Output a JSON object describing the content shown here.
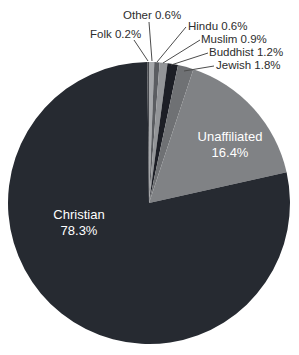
{
  "chart_data": {
    "type": "pie",
    "title": "",
    "unit": "%",
    "total": 100.0,
    "direction": "clockwise",
    "start_angle_deg": 0,
    "legend": "none",
    "label_color_outside": "#2d2d2d",
    "label_color_inside": "#ffffff",
    "geometry": {
      "cx": 149,
      "cy": 203,
      "r": 141
    },
    "slices": [
      {
        "label": "Other",
        "value": 0.6,
        "pct": "0.6%",
        "color": "#a6a8ab",
        "label_style": "callout",
        "label_pos": {
          "x": 123,
          "y": 19
        },
        "leader": {
          "x1": 149,
          "y1": 22,
          "x2": 152,
          "y2": 61
        }
      },
      {
        "label": "Hindu",
        "value": 0.6,
        "pct": "0.6%",
        "color": "#5b5d61",
        "label_style": "callout",
        "label_pos": {
          "x": 188,
          "y": 30
        },
        "leader": {
          "x1": 186,
          "y1": 27,
          "x2": 157,
          "y2": 62
        }
      },
      {
        "label": "Muslim",
        "value": 0.9,
        "pct": "0.9%",
        "color": "#939598",
        "label_style": "callout",
        "label_pos": {
          "x": 201,
          "y": 43
        },
        "leader": {
          "x1": 200,
          "y1": 40,
          "x2": 163,
          "y2": 63
        }
      },
      {
        "label": "Buddhist",
        "value": 1.2,
        "pct": "1.2%",
        "color": "#1c1e25",
        "label_style": "callout",
        "label_pos": {
          "x": 209,
          "y": 56
        },
        "leader": {
          "x1": 208,
          "y1": 53,
          "x2": 171,
          "y2": 65
        }
      },
      {
        "label": "Jewish",
        "value": 1.8,
        "pct": "1.8%",
        "color": "#6f7174",
        "label_style": "callout",
        "label_pos": {
          "x": 216,
          "y": 69
        },
        "leader": {
          "x1": 214,
          "y1": 66,
          "x2": 184,
          "y2": 71
        }
      },
      {
        "label": "Unaffiliated",
        "value": 16.4,
        "pct": "16.4%",
        "color": "#808285",
        "label_style": "inside",
        "label_pos": {
          "x": 230,
          "y": 141
        }
      },
      {
        "label": "Christian",
        "value": 78.3,
        "pct": "78.3%",
        "color": "#262a31",
        "label_style": "inside",
        "label_pos": {
          "x": 79,
          "y": 219
        }
      },
      {
        "label": "Folk",
        "value": 0.2,
        "pct": "0.2%",
        "color": "#47494e",
        "label_style": "callout",
        "label_pos": {
          "x": 90,
          "y": 38
        },
        "leader": {
          "x1": 134,
          "y1": 40,
          "x2": 148,
          "y2": 61
        }
      }
    ]
  }
}
